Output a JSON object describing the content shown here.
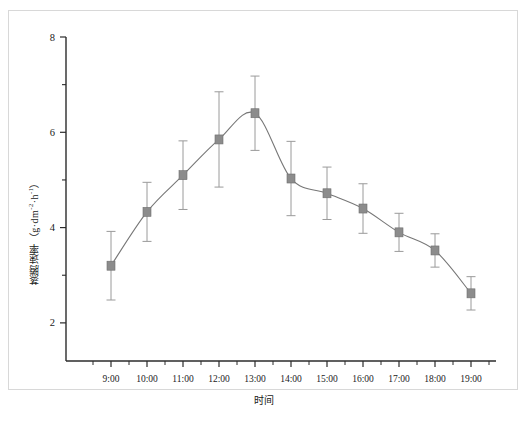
{
  "chart_data": {
    "type": "line",
    "title": "",
    "xlabel": "时间",
    "ylabel": "蒸腾速率（g·dm⁻²·h⁻¹）",
    "ylabel_main": "蒸腾速率",
    "ylabel_unit_open": "（g·dm",
    "ylabel_unit_sup1": "-2",
    "ylabel_unit_mid": "·h",
    "ylabel_unit_sup2": "-1",
    "ylabel_unit_close": "）",
    "categories": [
      "9:00",
      "10:00",
      "11:00",
      "12:00",
      "13:00",
      "14:00",
      "15:00",
      "16:00",
      "17:00",
      "18:00",
      "19:00"
    ],
    "values": [
      3.2,
      4.33,
      5.1,
      5.85,
      6.4,
      5.03,
      4.72,
      4.4,
      3.9,
      3.52,
      2.62
    ],
    "error_up": [
      0.72,
      0.62,
      0.72,
      1.0,
      0.78,
      0.78,
      0.55,
      0.52,
      0.4,
      0.35,
      0.35
    ],
    "error_down": [
      0.72,
      0.62,
      0.72,
      1.0,
      0.78,
      0.78,
      0.55,
      0.52,
      0.4,
      0.35,
      0.35
    ],
    "ylim": [
      1.2,
      8
    ],
    "yticks_major": [
      2,
      4,
      6,
      8
    ],
    "yticks_minor": [
      3,
      5,
      7
    ],
    "grid": false,
    "legend": "none",
    "marker": "square",
    "marker_color": "#8c8c8c",
    "line_color": "#777777",
    "errorbar_color": "#9a9a9a",
    "axis_color": "#2b2b2b"
  },
  "figure": {
    "caption": "",
    "frame_color": "#d8d8d8"
  }
}
